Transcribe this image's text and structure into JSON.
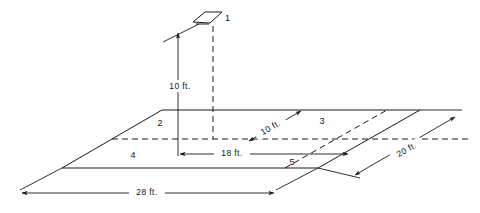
{
  "diagram": {
    "stroke_color": "#1a1a1a",
    "background_color": "#ffffff",
    "parts": [
      {
        "id": "part-1",
        "label": "1",
        "x": 222,
        "y": 18
      }
    ],
    "regions": [
      {
        "id": "region-2",
        "label": "2",
        "x": 160,
        "y": 126
      },
      {
        "id": "region-3",
        "label": "3",
        "x": 322,
        "y": 124
      },
      {
        "id": "region-4",
        "label": "4",
        "x": 133,
        "y": 158
      },
      {
        "id": "region-5",
        "label": "5",
        "x": 292,
        "y": 165
      }
    ],
    "dimensions": [
      {
        "id": "height-10ft",
        "label": "10 ft.",
        "x": 184,
        "y": 87,
        "rotation": 0
      },
      {
        "id": "depth-10ft",
        "label": "10 ft.",
        "x": 272,
        "y": 130,
        "rotation": -30
      },
      {
        "id": "width-18ft",
        "label": "18 ft.",
        "x": 232,
        "y": 159,
        "rotation": 0
      },
      {
        "id": "side-20ft",
        "label": "20 ft.",
        "x": 408,
        "y": 152,
        "rotation": -30
      },
      {
        "id": "base-28ft",
        "label": "28 ft.",
        "x": 147,
        "y": 197,
        "rotation": 0
      }
    ]
  }
}
